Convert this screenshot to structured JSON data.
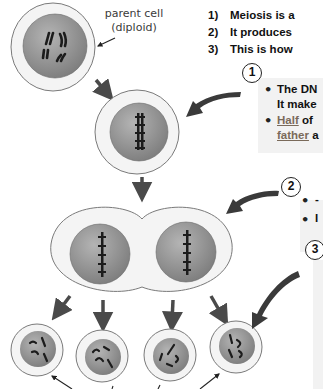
{
  "diagram": {
    "topic": "Meiosis",
    "colors": {
      "cytoplasm": "#f4f4f4",
      "cell_outline": "#7a7a7a",
      "nucleus": "#8c8c8c",
      "nucleus_highlight": "#b0b0b0",
      "chromosome": "#1c1c1c",
      "arrow": "#4a4a4a",
      "panel_bg": "#f2f2f2",
      "underline_text": "#7a6a5a"
    },
    "stages": [
      {
        "id": "parent",
        "label": "parent cell (diploid)",
        "cells": 1
      },
      {
        "id": "dna-replicated",
        "cells": 1
      },
      {
        "id": "first-division",
        "cells": 2
      },
      {
        "id": "gametes",
        "cells": 4
      }
    ]
  },
  "labels": {
    "parent_cell_line1": "parent cell",
    "parent_cell_line2": "(diploid)"
  },
  "intro": {
    "items": [
      {
        "num": "1)",
        "text": "Meiosis is a"
      },
      {
        "num": "2)",
        "text": "It produces"
      },
      {
        "num": "3)",
        "text": "This is how"
      }
    ]
  },
  "steps": [
    {
      "badge": "1",
      "bullets": [
        {
          "lines": [
            "The DN",
            "It make"
          ]
        },
        {
          "underlined": "Half",
          "rest": " of",
          "line2_underlined": "father",
          "line2_rest": " a"
        }
      ]
    },
    {
      "badge": "2",
      "bullets": [
        {
          "text": "-"
        },
        {
          "text": "I"
        }
      ]
    },
    {
      "badge": "3",
      "bullets": []
    }
  ]
}
